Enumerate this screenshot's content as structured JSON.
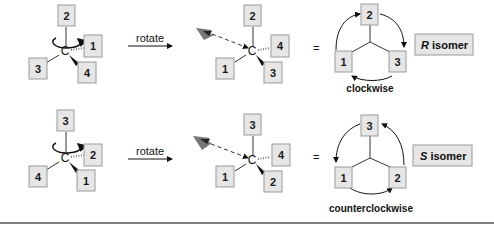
{
  "rows": [
    {
      "start": {
        "top": "2",
        "right_hashed": "1",
        "left": "3",
        "wedge": "4",
        "center": "C"
      },
      "arrow_label": "rotate",
      "rotated": {
        "top": "2",
        "right_hashed": "4",
        "left": "1",
        "wedge": "3",
        "center": "C"
      },
      "equals": "=",
      "projection": {
        "top": "2",
        "left": "1",
        "right": "3"
      },
      "direction": "clockwise",
      "isomer_letter": "R",
      "isomer_word": " isomer"
    },
    {
      "start": {
        "top": "3",
        "right_hashed": "2",
        "left": "4",
        "wedge": "1",
        "center": "C"
      },
      "arrow_label": "rotate",
      "rotated": {
        "top": "3",
        "right_hashed": "4",
        "left": "1",
        "wedge": "2",
        "center": "C"
      },
      "equals": "=",
      "projection": {
        "top": "3",
        "left": "1",
        "right": "2"
      },
      "direction": "counterclockwise",
      "isomer_letter": "S",
      "isomer_word": " isomer"
    }
  ],
  "colors": {
    "box_fill": "#e6e6e6",
    "box_stroke": "#9a9a9a",
    "divider": "#555555"
  }
}
